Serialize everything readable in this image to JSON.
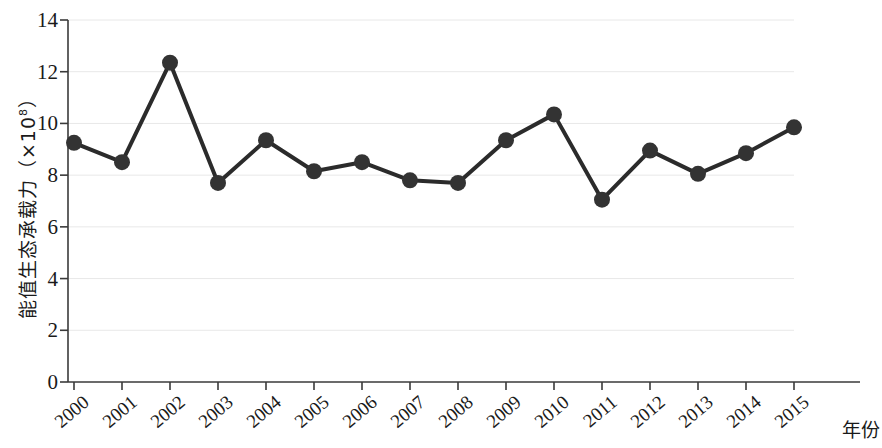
{
  "chart_data": {
    "type": "line",
    "title": "",
    "xlabel": "年份",
    "ylabel": "能值生态承载力（×10⁸）",
    "ylabel_main": "能值生态承载力（×10",
    "ylabel_exp": "8",
    "ylabel_tail": "）",
    "categories": [
      "2000",
      "2001",
      "2002",
      "2003",
      "2004",
      "2005",
      "2006",
      "2007",
      "2008",
      "2009",
      "2010",
      "2011",
      "2012",
      "2013",
      "2014",
      "2015"
    ],
    "values": [
      9.25,
      8.5,
      12.35,
      7.7,
      9.35,
      8.15,
      8.5,
      7.8,
      7.7,
      9.35,
      10.35,
      7.05,
      8.95,
      8.05,
      8.85,
      9.85
    ],
    "series": [
      {
        "name": "能值生态承载力",
        "values": [
          9.25,
          8.5,
          12.35,
          7.7,
          9.35,
          8.15,
          8.5,
          7.8,
          7.7,
          9.35,
          10.35,
          7.05,
          8.95,
          8.05,
          8.85,
          9.85
        ]
      }
    ],
    "ylim": [
      0,
      14
    ],
    "ytick_values": [
      "14",
      "12",
      "10",
      "8",
      "6",
      "4",
      "2",
      "0"
    ],
    "ytick_numbers": [
      14,
      12,
      10,
      8,
      6,
      4,
      2,
      0
    ],
    "ytick_step": 2,
    "grid": true,
    "grid_axis": "y",
    "legend": "none",
    "marker": "circle",
    "marker_color": "#333333",
    "line_color": "#2b2b2b",
    "grid_color": "#e8e8e8",
    "axis_color": "#3a3a3a",
    "xtick_rotation": -40
  }
}
